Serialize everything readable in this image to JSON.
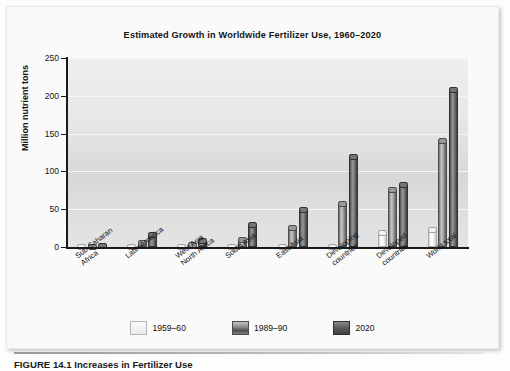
{
  "figure": {
    "caption_number": "FIGURE 14.1",
    "caption_text": "Increases in Fertilizer Use"
  },
  "chart_data": {
    "type": "bar",
    "title": "Estimated Growth in Worldwide Fertilizer Use, 1960–2020",
    "xlabel": "",
    "ylabel": "Million nutrient tons",
    "ylim": [
      0,
      250
    ],
    "yticks": [
      0,
      50,
      100,
      150,
      200,
      250
    ],
    "ytick_labels": [
      "0",
      "50",
      "100",
      "150",
      "200",
      "250"
    ],
    "grid": true,
    "legend_position": "bottom",
    "categories": [
      "Sub-Saharan\nAfrica",
      "Latin America",
      "West Asia\nNorth Africa",
      "South Asia",
      "East Asia",
      "Developing\ncountries",
      "Developed\ncountries",
      "World total"
    ],
    "series": [
      {
        "name": "1959–60",
        "color": "#f2f2f2",
        "values": [
          1,
          2,
          1,
          1,
          2,
          2,
          21,
          25
        ]
      },
      {
        "name": "1989–90",
        "color": "#8e8e8e",
        "values": [
          3,
          8,
          5,
          12,
          28,
          60,
          78,
          143
        ]
      },
      {
        "name": "2020",
        "color": "#565656",
        "values": [
          4,
          18,
          10,
          32,
          52,
          122,
          85,
          210
        ]
      }
    ]
  }
}
